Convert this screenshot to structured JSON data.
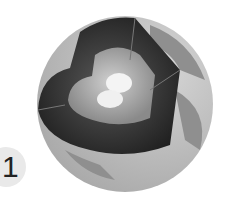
{
  "diagram": {
    "label": "1",
    "colors": {
      "surface": "#bdbdbd",
      "continents": "#8f8f8f",
      "mantle": "#3a3a3a",
      "outer_core": "#a8a8a8",
      "inner_core": "#f4f4f4",
      "badge": "#e9e9e9"
    }
  }
}
